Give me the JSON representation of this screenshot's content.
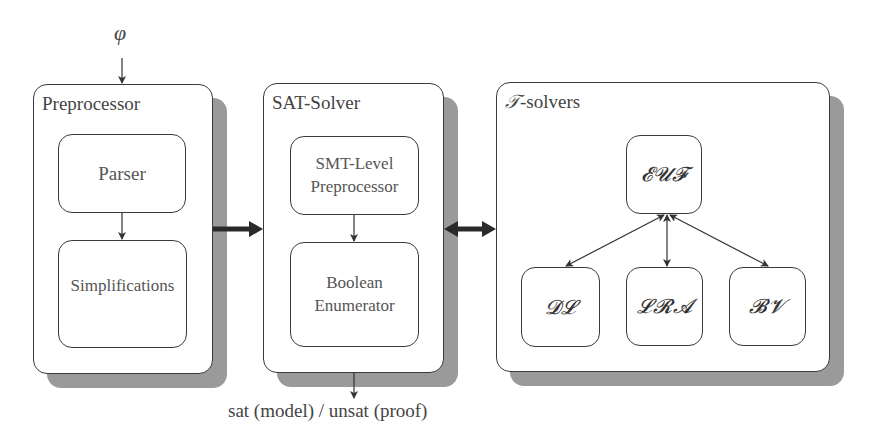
{
  "input": {
    "symbol": "φ"
  },
  "output": {
    "label": "sat (model) / unsat (proof)"
  },
  "preprocessor": {
    "title": "Preprocessor",
    "components": [
      {
        "label": "Parser"
      },
      {
        "label": "Simplifications"
      }
    ]
  },
  "sat_solver": {
    "title": "SAT-Solver",
    "components": [
      {
        "line1": "SMT-Level",
        "line2": "Preprocessor"
      },
      {
        "line1": "Boolean",
        "line2": "Enumerator"
      }
    ]
  },
  "t_solvers": {
    "title_symbol": "𝒯",
    "title_rest": "-solvers",
    "hub": {
      "label": "𝓔𝓤𝓕"
    },
    "theories": [
      {
        "label": "𝓓𝓛"
      },
      {
        "label": "𝓛𝓡𝓐"
      },
      {
        "label": "𝓑𝓥"
      }
    ]
  },
  "colors": {
    "stroke": "#3a3a3a",
    "shadow": "#9a9a9a",
    "background": "#ffffff"
  }
}
